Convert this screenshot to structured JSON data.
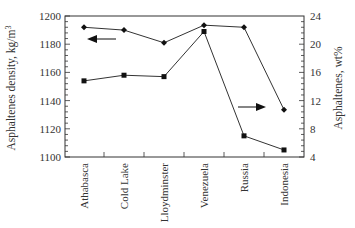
{
  "chart_data": {
    "type": "line",
    "title": "",
    "categories": [
      "Athabasca",
      "Cold Lake",
      "Lloydminster",
      "Venezuela",
      "Russia",
      "Indonesia"
    ],
    "xlabel": "",
    "ylabel": "Asphaltenes density, kg/m³",
    "y2label": "Asphaltenes, wt%",
    "ylim": [
      1100,
      1200
    ],
    "y2lim": [
      4,
      24
    ],
    "yticks": [
      1100,
      1120,
      1140,
      1160,
      1180,
      1200
    ],
    "y2ticks": [
      4,
      8,
      12,
      16,
      20,
      24
    ],
    "grid": false,
    "legend": "none (arrows indicate axis)",
    "series": [
      {
        "name": "Asphaltenes density",
        "axis": "left",
        "marker": "square",
        "values": [
          1154,
          1158,
          1157,
          1189,
          1115,
          1105
        ]
      },
      {
        "name": "Asphaltenes content",
        "axis": "right",
        "marker": "diamond",
        "values": [
          22.4,
          22.0,
          20.2,
          22.7,
          22.4,
          10.7
        ]
      }
    ],
    "annotations": [
      {
        "type": "arrow",
        "direction": "left",
        "refers_to": "Asphaltenes content (left axis indicator)"
      },
      {
        "type": "arrow",
        "direction": "right",
        "refers_to": "Asphaltenes density (right axis indicator)"
      }
    ]
  },
  "labels": {
    "ylabel": "Asphaltenes density, kg/m",
    "ylabel_sup": "3",
    "y2label": "Asphaltenes, wt%"
  }
}
